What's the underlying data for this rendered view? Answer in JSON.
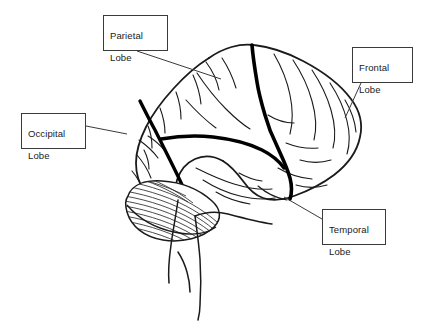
{
  "diagram": {
    "stroke_color": "#1a1a1a",
    "thick_sulcus_color": "#000000",
    "background_color": "#ffffff",
    "box_border_color": "#3a3a3a",
    "text_color": "#1a1a1a"
  },
  "labels": [
    {
      "id": "parietal",
      "name": "parietal-lobe-label",
      "line1": "Parietal",
      "line2": "Lobe",
      "box": {
        "x": 103,
        "y": 15,
        "w": 65,
        "h": 36
      },
      "leader": {
        "x1": 137,
        "y1": 51,
        "x2": 221,
        "y2": 79
      }
    },
    {
      "id": "frontal",
      "name": "frontal-lobe-label",
      "line1": "Frontal",
      "line2": "Lobe",
      "box": {
        "x": 352,
        "y": 47,
        "w": 61,
        "h": 36
      },
      "leader": {
        "x1": 361,
        "y1": 83,
        "x2": 345,
        "y2": 118
      }
    },
    {
      "id": "occipital",
      "name": "occipital-lobe-label",
      "line1": "Occipital",
      "line2": "Lobe",
      "box": {
        "x": 21,
        "y": 113,
        "w": 65,
        "h": 36
      },
      "leader": {
        "x1": 86,
        "y1": 126,
        "x2": 127,
        "y2": 134
      }
    },
    {
      "id": "temporal",
      "name": "temporal-lobe-label",
      "line1": "Temporal",
      "line2": "Lobe",
      "box": {
        "x": 322,
        "y": 209,
        "w": 64,
        "h": 36
      },
      "leader": {
        "x1": 322,
        "y1": 219,
        "x2": 284,
        "y2": 197
      }
    }
  ],
  "structures": [
    {
      "name": "cerebrum-outline",
      "kind": "outline"
    },
    {
      "name": "central-sulcus",
      "kind": "thick-sulcus"
    },
    {
      "name": "lateral-sulcus",
      "kind": "thick-sulcus"
    },
    {
      "name": "parieto-occipital-sulcus",
      "kind": "thick-sulcus"
    },
    {
      "name": "cerebellum",
      "kind": "hatched"
    },
    {
      "name": "brainstem",
      "kind": "outline"
    },
    {
      "name": "gyri-folds",
      "kind": "thin-lines"
    }
  ]
}
